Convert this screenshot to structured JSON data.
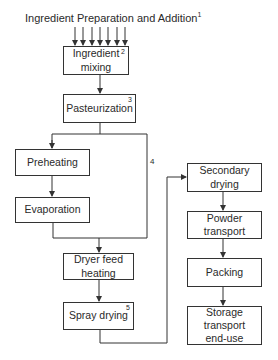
{
  "title": {
    "text": "Ingredient Preparation and Addition",
    "superscript": "1"
  },
  "boxes": {
    "ingredient_mixing": {
      "label": "Ingredient\nmixing",
      "number": "2"
    },
    "pasteurization": {
      "label": "Pasteurization",
      "number": "3"
    },
    "preheating": {
      "label": "Preheating"
    },
    "evaporation": {
      "label": "Evaporation"
    },
    "dryer_feed_heating": {
      "label": "Dryer feed\nheating"
    },
    "spray_drying": {
      "label": "Spray drying",
      "number": "5"
    },
    "secondary_drying": {
      "label": "Secondary\ndrying"
    },
    "powder_transport": {
      "label": "Powder\ntransport"
    },
    "packing": {
      "label": "Packing"
    },
    "storage": {
      "label": "Storage\ntransport\nend-use"
    }
  },
  "bypass_label": "4",
  "input_arrow_count": 7,
  "colors": {
    "line": "#333333",
    "text": "#2a2a2a",
    "background": "#ffffff"
  }
}
